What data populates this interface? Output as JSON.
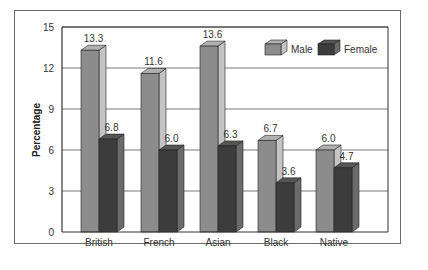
{
  "chart_data": {
    "type": "bar",
    "title": "",
    "xlabel": "",
    "ylabel": "Percentage",
    "ylim": [
      0,
      15
    ],
    "yticks": [
      0,
      3,
      6,
      9,
      12,
      15
    ],
    "grid": true,
    "legend_position": "top-right",
    "categories": [
      "British",
      "French",
      "Asian",
      "Black",
      "Native"
    ],
    "series": [
      {
        "name": "Male",
        "values": [
          13.3,
          11.6,
          13.6,
          6.7,
          6.0
        ],
        "color": "#8c8c8c"
      },
      {
        "name": "Female",
        "values": [
          6.8,
          6.0,
          6.3,
          3.6,
          4.7
        ],
        "color": "#3c3c3c"
      }
    ],
    "style": "3d-bar"
  },
  "colors": {
    "male_front": "#8c8c8c",
    "male_side": "#c4c4c4",
    "male_top": "#b0b0b0",
    "female_front": "#3c3c3c",
    "female_side": "#6a6a6a",
    "female_top": "#555555",
    "grid": "#555555",
    "axis": "#333333"
  }
}
